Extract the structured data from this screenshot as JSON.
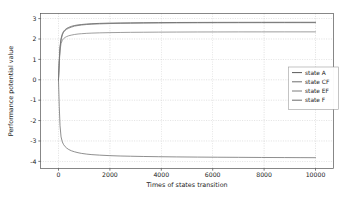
{
  "chart_data": {
    "type": "line",
    "title": "",
    "xlabel": "Times of states transition",
    "ylabel": "Performance potential value",
    "xlim": [
      -700,
      10700
    ],
    "ylim": [
      -4.35,
      3.25
    ],
    "xticks": [
      0,
      2000,
      4000,
      6000,
      8000,
      10000
    ],
    "xtick_labels": [
      "0",
      "2000",
      "4000",
      "6000",
      "8000",
      "10000"
    ],
    "yticks": [
      -4,
      -3,
      -2,
      -1,
      0,
      1,
      2,
      3
    ],
    "ytick_labels": [
      "-4",
      "-3",
      "-2",
      "-1",
      "0",
      "1",
      "2",
      "3"
    ],
    "grid": true,
    "grid_color": "#b8b8b8",
    "legend_position": "center right",
    "series": [
      {
        "name": "state A",
        "color": "#5a5a5a",
        "asymptote": 2.82,
        "start": 0.0,
        "x": [
          0,
          30,
          60,
          100,
          150,
          200,
          260,
          320,
          400,
          500,
          620,
          760,
          900,
          1100,
          1300,
          1600,
          2000,
          2400,
          2800,
          3300,
          3900,
          4600,
          5400,
          6200,
          7000,
          7900,
          8800,
          9400,
          10000
        ],
        "values": [
          0.0,
          0.95,
          1.62,
          2.02,
          2.26,
          2.38,
          2.46,
          2.52,
          2.57,
          2.62,
          2.66,
          2.69,
          2.71,
          2.735,
          2.75,
          2.765,
          2.78,
          2.787,
          2.793,
          2.799,
          2.804,
          2.809,
          2.812,
          2.815,
          2.817,
          2.818,
          2.819,
          2.82,
          2.82
        ]
      },
      {
        "name": "state CF",
        "color": "#6e6e6e",
        "asymptote": 2.8,
        "start": 0.0,
        "x": [
          0,
          30,
          60,
          100,
          150,
          200,
          260,
          320,
          400,
          500,
          620,
          760,
          900,
          1100,
          1300,
          1600,
          2000,
          2400,
          2800,
          3300,
          3900,
          4600,
          5400,
          6200,
          7000,
          7900,
          8800,
          9400,
          10000
        ],
        "values": [
          0.0,
          0.9,
          1.55,
          1.95,
          2.2,
          2.33,
          2.42,
          2.48,
          2.53,
          2.58,
          2.63,
          2.66,
          2.685,
          2.71,
          2.726,
          2.742,
          2.757,
          2.766,
          2.772,
          2.779,
          2.785,
          2.79,
          2.794,
          2.796,
          2.798,
          2.799,
          2.8,
          2.8,
          2.8
        ]
      },
      {
        "name": "state EF",
        "color": "#7d7d7d",
        "asymptote": 2.35,
        "start": 0.0,
        "x": [
          0,
          30,
          60,
          100,
          150,
          200,
          260,
          320,
          400,
          500,
          620,
          760,
          900,
          1100,
          1300,
          1600,
          2000,
          2400,
          2800,
          3300,
          3900,
          4600,
          5400,
          6200,
          7000,
          7900,
          8800,
          9400,
          10000
        ],
        "values": [
          0.0,
          0.82,
          1.42,
          1.78,
          1.94,
          2.02,
          2.08,
          2.12,
          2.16,
          2.19,
          2.22,
          2.245,
          2.26,
          2.277,
          2.289,
          2.301,
          2.312,
          2.32,
          2.326,
          2.331,
          2.336,
          2.34,
          2.344,
          2.346,
          2.348,
          2.349,
          2.35,
          2.35,
          2.35
        ]
      },
      {
        "name": "state F",
        "color": "#6a6a6a",
        "asymptote": -3.82,
        "start": 0.0,
        "x": [
          0,
          30,
          60,
          100,
          150,
          200,
          260,
          320,
          400,
          500,
          620,
          760,
          900,
          1100,
          1300,
          1600,
          2000,
          2400,
          2800,
          3300,
          3900,
          4600,
          5400,
          6200,
          7000,
          7900,
          8800,
          9400,
          10000
        ],
        "values": [
          0.0,
          -1.3,
          -2.25,
          -2.8,
          -3.05,
          -3.18,
          -3.28,
          -3.35,
          -3.42,
          -3.48,
          -3.53,
          -3.575,
          -3.61,
          -3.645,
          -3.67,
          -3.695,
          -3.72,
          -3.737,
          -3.748,
          -3.76,
          -3.772,
          -3.782,
          -3.79,
          -3.797,
          -3.803,
          -3.809,
          -3.814,
          -3.817,
          -3.82
        ]
      }
    ]
  },
  "legend": {
    "entries": [
      {
        "label": "state A"
      },
      {
        "label": "state CF"
      },
      {
        "label": "state EF"
      },
      {
        "label": "state F"
      }
    ]
  }
}
